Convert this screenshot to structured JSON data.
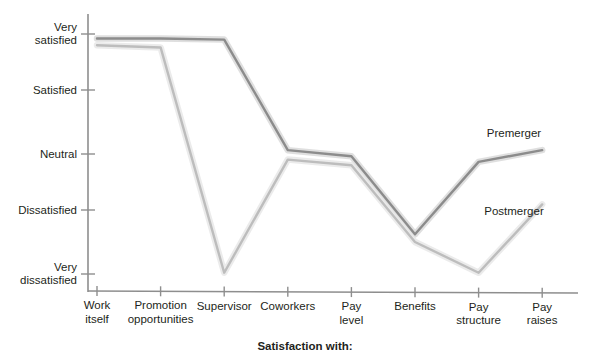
{
  "chart_data": {
    "type": "line",
    "title": "",
    "xlabel": "Satisfaction with:",
    "ylabel": "",
    "categories": [
      "Work\nitself",
      "Promotion\nopportunities",
      "Supervisor",
      "Coworkers",
      "Pay\nlevel",
      "Benefits",
      "Pay\nstructure",
      "Pay\nraises"
    ],
    "y_tick_labels": [
      "Very\nsatisfied",
      "Satisfied",
      "Neutral",
      "Dissatisfied",
      "Very\ndissatisfied"
    ],
    "y_tick_values": [
      5,
      4,
      3,
      2,
      1
    ],
    "ylim": [
      1,
      5
    ],
    "grid": false,
    "legend_position": "inline-right",
    "series": [
      {
        "name": "Premerger",
        "color": "#8c8c8c",
        "values": [
          4.92,
          4.92,
          4.9,
          3.06,
          2.96,
          1.62,
          2.86,
          3.06
        ]
      },
      {
        "name": "Postmerger",
        "color": "#bdbdbd",
        "values": [
          4.8,
          4.76,
          1.02,
          2.9,
          2.8,
          1.5,
          1.02,
          2.1
        ]
      }
    ],
    "annotations": [
      {
        "text": "Premerger",
        "x": 542,
        "y": 134
      },
      {
        "text": "Postmerger",
        "x": 542,
        "y": 212
      }
    ]
  },
  "axis": {
    "caption": "Satisfaction with:",
    "line_color": "#7a7a7a"
  }
}
